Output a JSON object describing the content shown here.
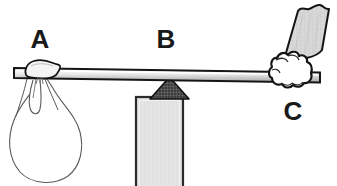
{
  "figure": {
    "type": "physics-lever-diagram",
    "title": "",
    "background_color": "#ffffff",
    "width": 337,
    "height": 186,
    "labels": [
      {
        "id": "A",
        "text": "A",
        "x": 40,
        "y": 48,
        "font_size": 26,
        "refers_to": "hanging-sack-load"
      },
      {
        "id": "B",
        "text": "B",
        "x": 166,
        "y": 48,
        "font_size": 26,
        "refers_to": "fulcrum-and-support-block"
      },
      {
        "id": "C",
        "text": "C",
        "x": 293,
        "y": 120,
        "font_size": 26,
        "refers_to": "hand-gripping-bar"
      }
    ],
    "parts": {
      "lever_bar": {
        "name": "lever-bar",
        "left_x": 14,
        "right_x": 320,
        "left_y": 68,
        "right_y": 72,
        "thickness": 10,
        "fill_top": "#ffffff",
        "fill_bottom": "#b4b4b4",
        "stroke": "#1a1a1a"
      },
      "fulcrum": {
        "name": "fulcrum-triangle",
        "apex_x": 169,
        "apex_y": 78,
        "base_left_x": 151,
        "base_right_x": 188,
        "base_y": 99,
        "fill": "#4a4a4a",
        "stroke": "#1a1a1a"
      },
      "support_block": {
        "name": "support-block",
        "x": 136,
        "y": 97,
        "width": 47,
        "height": 89,
        "fill": "#e2e2e2",
        "stroke": "#2b2b2b"
      },
      "sack": {
        "name": "hanging-sack",
        "center_x": 46,
        "center_y": 140,
        "width": 68,
        "height": 92,
        "fill": "#ffffff",
        "stroke": "#555555"
      },
      "knot": {
        "name": "cloth-knot",
        "x": 28,
        "y": 62,
        "width": 32,
        "height": 14,
        "fill": "#f2f2f2",
        "stroke": "#1a1a1a"
      },
      "hand": {
        "name": "fist-gripping-bar",
        "center_x": 292,
        "center_y": 72,
        "fill": "#ffffff",
        "stroke": "#1a1a1a"
      },
      "sleeve": {
        "name": "shirt-sleeve",
        "fill": "#d4d4d4",
        "stroke": "#1a1a1a",
        "angle_deg": -22
      }
    },
    "colors": {
      "outline": "#1a1a1a",
      "bar_highlight": "#ffffff",
      "bar_shadow": "#b4b4b4",
      "block_fill": "#e2e2e2",
      "fulcrum_fill": "#4a4a4a",
      "sleeve_fill": "#d4d4d4",
      "label_color": "#191919"
    }
  }
}
